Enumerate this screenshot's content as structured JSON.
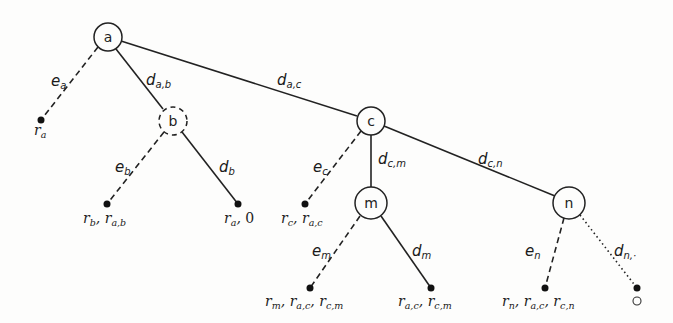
{
  "diagram": {
    "type": "tree",
    "nodes": [
      {
        "id": "a",
        "label": "a",
        "style": "solid",
        "x": 108,
        "y": 37,
        "r": 14
      },
      {
        "id": "b",
        "label": "b",
        "style": "dashed",
        "x": 173,
        "y": 121,
        "r": 14
      },
      {
        "id": "c",
        "label": "c",
        "style": "solid",
        "x": 371,
        "y": 121,
        "r": 14
      },
      {
        "id": "m",
        "label": "m",
        "style": "solid",
        "x": 371,
        "y": 203,
        "r": 16
      },
      {
        "id": "n",
        "label": "n",
        "style": "solid",
        "x": 569,
        "y": 203,
        "r": 16
      }
    ],
    "leaves": [
      {
        "id": "leaf-ra",
        "x": 41,
        "y": 120,
        "label_main": "r",
        "label_sub": "a",
        "label_rest": ""
      },
      {
        "id": "leaf-rb",
        "x": 107,
        "y": 204,
        "label": "r_b, r_{a,b}"
      },
      {
        "id": "leaf-ra0",
        "x": 238,
        "y": 204,
        "label": "r_a, 0"
      },
      {
        "id": "leaf-rc",
        "x": 305,
        "y": 204,
        "label": "r_c, r_{a,c}"
      },
      {
        "id": "leaf-rm",
        "x": 310,
        "y": 288,
        "label": "r_m, r_{a,c}, r_{c,m}"
      },
      {
        "id": "leaf-racm",
        "x": 431,
        "y": 288,
        "label": "r_{a,c}, r_{c,m}"
      },
      {
        "id": "leaf-rn",
        "x": 545,
        "y": 288,
        "label": "r_n, r_{a,c}, r_{c,n}"
      },
      {
        "id": "leaf-empty",
        "x": 637,
        "y": 288,
        "label": "○"
      }
    ],
    "edges": [
      {
        "from": "a",
        "to": "leaf-ra",
        "style": "dashed",
        "label": "e",
        "sub": "a"
      },
      {
        "from": "a",
        "to": "b",
        "style": "solid",
        "label": "d",
        "sub": "a,b"
      },
      {
        "from": "a",
        "to": "c",
        "style": "solid",
        "label": "d",
        "sub": "a,c"
      },
      {
        "from": "b",
        "to": "leaf-rb",
        "style": "dashed",
        "label": "e",
        "sub": "b"
      },
      {
        "from": "b",
        "to": "leaf-ra0",
        "style": "solid",
        "label": "d",
        "sub": "b"
      },
      {
        "from": "c",
        "to": "leaf-rc",
        "style": "dashed",
        "label": "e",
        "sub": "c"
      },
      {
        "from": "c",
        "to": "m",
        "style": "solid",
        "label": "d",
        "sub": "c,m"
      },
      {
        "from": "c",
        "to": "n",
        "style": "solid",
        "label": "d",
        "sub": "c,n"
      },
      {
        "from": "m",
        "to": "leaf-rm",
        "style": "dashed",
        "label": "e",
        "sub": "m"
      },
      {
        "from": "m",
        "to": "leaf-racm",
        "style": "solid",
        "label": "d",
        "sub": "m"
      },
      {
        "from": "n",
        "to": "leaf-rn",
        "style": "dashed",
        "label": "e",
        "sub": "n"
      },
      {
        "from": "n",
        "to": "leaf-empty",
        "style": "dotted",
        "label": "d",
        "sub": "n,·"
      }
    ]
  },
  "labels": {
    "node_a": "a",
    "node_b": "b",
    "node_c": "c",
    "node_m": "m",
    "node_n": "n",
    "e": "e",
    "d": "d",
    "r": "r",
    "sub_a": "a",
    "sub_b": "b",
    "sub_c": "c",
    "sub_m": "m",
    "sub_n": "n",
    "sub_ab": "a,b",
    "sub_ac": "a,c",
    "sub_cm": "c,m",
    "sub_cn": "c,n",
    "sub_ndot": "n,·",
    "comma": ", ",
    "zero": "0",
    "empty_symbol": "○"
  },
  "colors": {
    "stroke": "#222222",
    "background": "#fdfdfc"
  }
}
